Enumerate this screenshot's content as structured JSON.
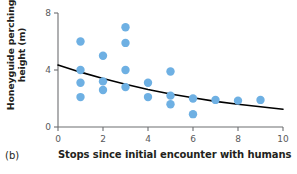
{
  "panel": {
    "label": "(b)"
  },
  "axes": {
    "ylabel_line1": "Honeyguide perching",
    "ylabel_line2": "height (m)",
    "xlabel": "Stops since initial encounter with humans",
    "x_ticks": [
      "0",
      "2",
      "4",
      "6",
      "8",
      "10"
    ],
    "y_ticks": [
      "0",
      "4",
      "8"
    ]
  },
  "colors": {
    "point": "#6eb0e3",
    "trend": "#000000",
    "axis": "#6d6e71",
    "text": "#231f20"
  },
  "chart_data": {
    "type": "scatter",
    "title": "",
    "xlabel": "Stops since initial encounter with humans",
    "ylabel": "Honeyguide perching height (m)",
    "xlim": [
      0,
      10
    ],
    "ylim": [
      0,
      8
    ],
    "xticks": [
      0,
      2,
      4,
      6,
      8,
      10
    ],
    "yticks": [
      0,
      4,
      8
    ],
    "grid": false,
    "legend": "none",
    "points": [
      {
        "x": 1,
        "y": 6.0
      },
      {
        "x": 1,
        "y": 4.0
      },
      {
        "x": 1,
        "y": 3.1
      },
      {
        "x": 1,
        "y": 2.1
      },
      {
        "x": 2,
        "y": 5.0
      },
      {
        "x": 2,
        "y": 3.2
      },
      {
        "x": 2,
        "y": 2.6
      },
      {
        "x": 3,
        "y": 7.0
      },
      {
        "x": 3,
        "y": 5.9
      },
      {
        "x": 3,
        "y": 4.0
      },
      {
        "x": 3,
        "y": 2.8
      },
      {
        "x": 4,
        "y": 3.1
      },
      {
        "x": 4,
        "y": 2.1
      },
      {
        "x": 5,
        "y": 3.9
      },
      {
        "x": 5,
        "y": 2.2
      },
      {
        "x": 5,
        "y": 1.6
      },
      {
        "x": 6,
        "y": 2.0
      },
      {
        "x": 6,
        "y": 0.9
      },
      {
        "x": 7,
        "y": 1.9
      },
      {
        "x": 8,
        "y": 1.85
      },
      {
        "x": 9,
        "y": 1.9
      }
    ],
    "trend_line": {
      "description": "fitted decreasing curve",
      "points": [
        {
          "x": 0,
          "y": 4.35
        },
        {
          "x": 1,
          "y": 3.85
        },
        {
          "x": 2,
          "y": 3.4
        },
        {
          "x": 3,
          "y": 3.0
        },
        {
          "x": 4,
          "y": 2.63
        },
        {
          "x": 5,
          "y": 2.32
        },
        {
          "x": 6,
          "y": 2.05
        },
        {
          "x": 7,
          "y": 1.8
        },
        {
          "x": 8,
          "y": 1.6
        },
        {
          "x": 9,
          "y": 1.42
        },
        {
          "x": 10,
          "y": 1.25
        }
      ]
    }
  }
}
